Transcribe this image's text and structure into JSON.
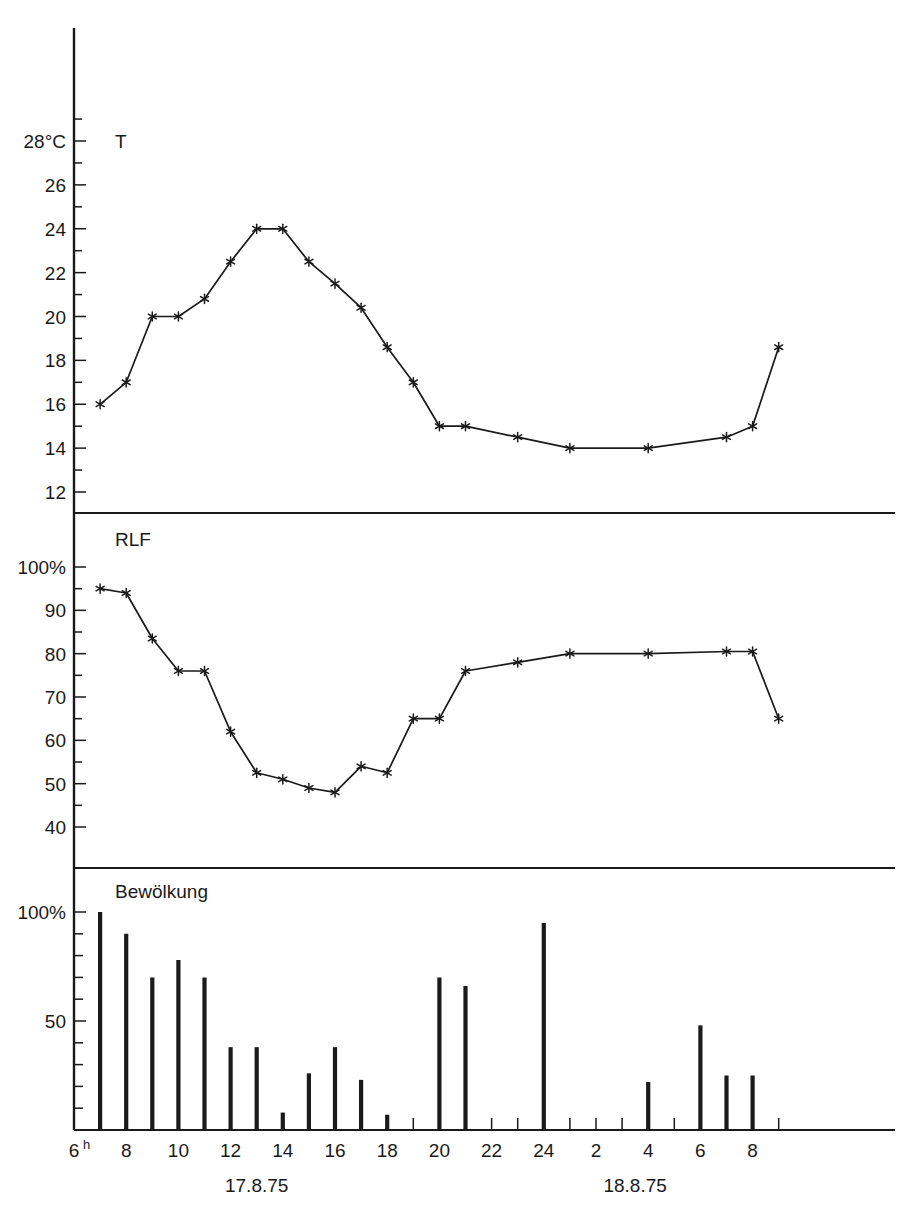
{
  "chart_data": [
    {
      "type": "line",
      "panel": "temperature",
      "title": "T",
      "ylabel": "28°C",
      "xlabel": "",
      "ylim": [
        11,
        29
      ],
      "yticks": [
        28,
        26,
        24,
        22,
        20,
        18,
        16,
        14,
        12
      ],
      "ytick_labels": [
        "28°C",
        "26",
        "24",
        "22",
        "20",
        "18",
        "16",
        "14",
        "12"
      ],
      "minor_tick_step": 1,
      "grid": false,
      "x": [
        7,
        8,
        9,
        10,
        11,
        12,
        13,
        14,
        15,
        16,
        17,
        18,
        19,
        20,
        21,
        23,
        25,
        28,
        31,
        32,
        33
      ],
      "x_hours": [
        "7",
        "8",
        "9",
        "10",
        "11",
        "12",
        "13",
        "14",
        "15",
        "16",
        "17",
        "18",
        "19",
        "20",
        "21",
        "23",
        "1",
        "4",
        "7",
        "8",
        "9"
      ],
      "values": [
        16,
        17,
        20,
        20,
        20.8,
        22.5,
        24,
        24,
        22.5,
        21.5,
        20.4,
        18.6,
        17,
        15,
        15,
        14.5,
        14,
        14,
        14.5,
        15,
        18.6
      ]
    },
    {
      "type": "line",
      "panel": "humidity",
      "title": "RLF",
      "ylabel": "100%",
      "xlabel": "",
      "ylim": [
        35,
        103
      ],
      "yticks": [
        100,
        90,
        80,
        70,
        60,
        50,
        40
      ],
      "ytick_labels": [
        "100%",
        "90",
        "80",
        "70",
        "60",
        "50",
        "40"
      ],
      "minor_tick_step": 5,
      "grid": false,
      "x": [
        7,
        8,
        9,
        10,
        11,
        12,
        13,
        14,
        15,
        16,
        17,
        18,
        19,
        20,
        21,
        23,
        25,
        28,
        31,
        32,
        33
      ],
      "x_hours": [
        "7",
        "8",
        "9",
        "10",
        "11",
        "12",
        "13",
        "14",
        "15",
        "16",
        "17",
        "18",
        "19",
        "20",
        "21",
        "23",
        "1",
        "4",
        "7",
        "8",
        "9"
      ],
      "values": [
        95,
        94,
        83.5,
        76,
        76,
        62,
        52.5,
        51,
        49,
        48,
        54,
        52.5,
        65,
        65,
        76,
        78,
        80,
        80,
        80.5,
        80.5,
        65
      ]
    },
    {
      "type": "bar",
      "panel": "cloudiness",
      "title": "Bewölkung",
      "ylabel": "100%",
      "xlabel": "",
      "ylim": [
        0,
        100
      ],
      "yticks": [
        100,
        50
      ],
      "ytick_labels": [
        "100%",
        "50"
      ],
      "minor_tick_step": 10,
      "grid": false,
      "categories": [
        "7",
        "8",
        "9",
        "10",
        "11",
        "12",
        "13",
        "14",
        "15",
        "16",
        "17",
        "18",
        "19",
        "20",
        "21",
        "22",
        "24",
        "4",
        "6",
        "7",
        "8"
      ],
      "x": [
        7,
        8,
        9,
        10,
        11,
        12,
        13,
        14,
        15,
        16,
        17,
        18,
        19,
        20,
        21,
        22,
        24,
        28,
        30,
        31,
        32
      ],
      "values": [
        100,
        90,
        70,
        78,
        70,
        38,
        38,
        8,
        26,
        38,
        23,
        7,
        0,
        70,
        66,
        0,
        95,
        0,
        22,
        48,
        25,
        25
      ]
    }
  ],
  "axis": {
    "x_ticks": [
      {
        "label": "6",
        "sup": "h",
        "value": 6
      },
      {
        "label": "8",
        "sup": "",
        "value": 8
      },
      {
        "label": "10",
        "sup": "",
        "value": 10
      },
      {
        "label": "12",
        "sup": "",
        "value": 12
      },
      {
        "label": "14",
        "sup": "",
        "value": 14
      },
      {
        "label": "16",
        "sup": "",
        "value": 16
      },
      {
        "label": "18",
        "sup": "",
        "value": 18
      },
      {
        "label": "20",
        "sup": "",
        "value": 20
      },
      {
        "label": "22",
        "sup": "",
        "value": 22
      },
      {
        "label": "24",
        "sup": "",
        "value": 24
      },
      {
        "label": "2",
        "sup": "",
        "value": 26
      },
      {
        "label": "4",
        "sup": "",
        "value": 28
      },
      {
        "label": "6",
        "sup": "",
        "value": 30
      },
      {
        "label": "8",
        "sup": "",
        "value": 32
      }
    ],
    "date_labels": [
      {
        "text": "17.8.75",
        "value": 13
      },
      {
        "text": "18.8.75",
        "value": 27.5
      }
    ]
  },
  "panels": {
    "temperature": {
      "label": "T"
    },
    "humidity": {
      "label": "RLF"
    },
    "cloudiness": {
      "label": "Bewölkung"
    }
  },
  "style": {
    "ink": "#1a1a1a",
    "background": "#ffffff"
  }
}
